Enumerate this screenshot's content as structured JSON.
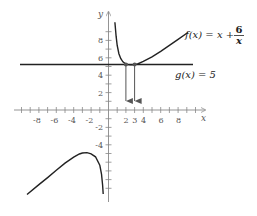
{
  "figure": {
    "title": "",
    "x_axis": {
      "label": "x",
      "ticks": [
        "-8",
        "-6",
        "-4",
        "-2",
        "2",
        "3",
        "4",
        "6",
        "8"
      ]
    },
    "y_axis": {
      "label": "y",
      "ticks": [
        "8",
        "6",
        "4",
        "2",
        "-2",
        "-4"
      ]
    },
    "functions": [
      {
        "name": "f",
        "label_prefix": "f(x) = x + ",
        "numerator": "6",
        "denominator": "x",
        "expression": "x + 6/x"
      },
      {
        "name": "g",
        "label": "g(x) = 5",
        "expression": "5"
      }
    ],
    "intersections": [
      {
        "x": 2,
        "y": 5
      },
      {
        "x": 3,
        "y": 5
      }
    ],
    "colors": {
      "curve": "#222222",
      "axis": "#888888",
      "arrow": "#555555"
    }
  }
}
